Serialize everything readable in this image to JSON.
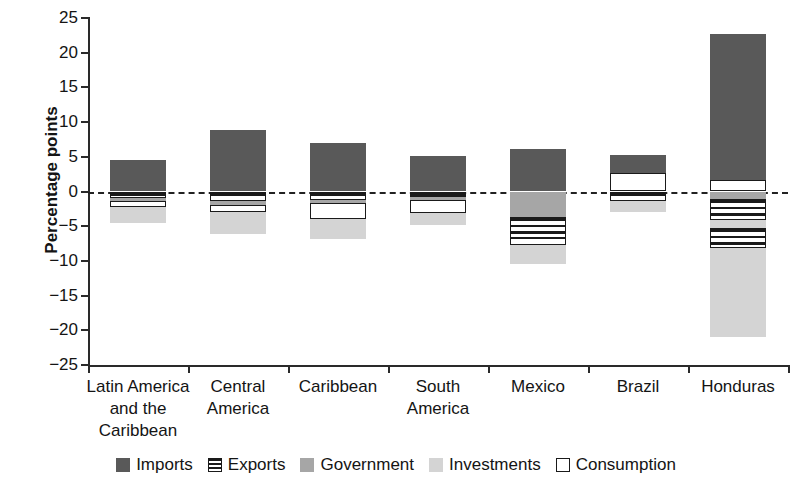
{
  "chart_data": {
    "type": "bar",
    "title": "",
    "subtitle": "",
    "xlabel": "",
    "ylabel": "Percentage points",
    "ylim": [
      -25,
      25
    ],
    "ytick_labels": [
      "25",
      "20",
      "15",
      "10",
      "5",
      "0",
      "-5",
      "-10",
      "-15",
      "-20",
      "-25"
    ],
    "ytick_values": [
      25,
      20,
      15,
      10,
      5,
      0,
      -5,
      -10,
      -15,
      -20,
      -25
    ],
    "grid": false,
    "zero_reference_line": true,
    "legend_position": "bottom",
    "stacked": true,
    "categories": [
      "Latin America\nand the\nCaribbean",
      "Central\nAmerica",
      "Caribbean",
      "South\nAmerica",
      "Mexico",
      "Brazil",
      "Honduras"
    ],
    "series": [
      {
        "name": "Imports",
        "color": "#595959",
        "values": [
          4.6,
          8.9,
          7.0,
          5.1,
          6.1,
          5.3,
          22.7
        ]
      },
      {
        "name": "Exports",
        "color": "#ffffff",
        "pattern": "horizontal-stripes",
        "values": [
          -1.0,
          -1.4,
          -1.2,
          -0.8,
          -3.0,
          -1.3,
          -3.0
        ]
      },
      {
        "name": "Government",
        "color": "#a6a6a6",
        "values": [
          -0.4,
          -0.6,
          -0.5,
          -0.4,
          -3.7,
          -0.5,
          -1.1
        ]
      },
      {
        "name": "Investments",
        "color": "#d4d4d4",
        "values": [
          -2.3,
          -3.2,
          -3.0,
          -1.7,
          -2.8,
          -1.6,
          -11.9
        ]
      },
      {
        "name": "Consumption",
        "color": "#ffffff",
        "values": [
          -0.9,
          -0.9,
          -2.2,
          -1.9,
          -1.0,
          -2.6,
          -1.7
        ]
      }
    ],
    "bars": [
      {
        "category": "Latin America and the Caribbean",
        "positive_stack": [
          {
            "series": "Imports",
            "from": 0.0,
            "to": 4.6
          }
        ],
        "negative_stack": [
          {
            "series": "Exports",
            "from": 0.0,
            "to": -1.0
          },
          {
            "series": "Government",
            "from": -1.0,
            "to": -1.4
          },
          {
            "series": "Consumption",
            "from": -1.4,
            "to": -2.3
          },
          {
            "series": "Investments",
            "from": -2.3,
            "to": -4.6
          }
        ]
      },
      {
        "category": "Central America",
        "positive_stack": [
          {
            "series": "Imports",
            "from": 0.0,
            "to": 8.9
          }
        ],
        "negative_stack": [
          {
            "series": "Exports",
            "from": 0.0,
            "to": -1.4
          },
          {
            "series": "Government",
            "from": -1.4,
            "to": -2.0
          },
          {
            "series": "Consumption",
            "from": -2.0,
            "to": -2.9
          },
          {
            "series": "Investments",
            "from": -2.9,
            "to": -6.1
          }
        ]
      },
      {
        "category": "Caribbean",
        "positive_stack": [
          {
            "series": "Imports",
            "from": 0.0,
            "to": 7.0
          }
        ],
        "negative_stack": [
          {
            "series": "Exports",
            "from": 0.0,
            "to": -1.2
          },
          {
            "series": "Government",
            "from": -1.2,
            "to": -1.7
          },
          {
            "series": "Consumption",
            "from": -1.7,
            "to": -3.9
          },
          {
            "series": "Investments",
            "from": -3.9,
            "to": -6.9
          }
        ]
      },
      {
        "category": "South America",
        "positive_stack": [
          {
            "series": "Imports",
            "from": 0.0,
            "to": 5.1
          }
        ],
        "negative_stack": [
          {
            "series": "Exports",
            "from": 0.0,
            "to": -0.8
          },
          {
            "series": "Government",
            "from": -0.8,
            "to": -1.2
          },
          {
            "series": "Consumption",
            "from": -1.2,
            "to": -3.1
          },
          {
            "series": "Investments",
            "from": -3.1,
            "to": -4.8
          }
        ]
      },
      {
        "category": "Mexico",
        "positive_stack": [
          {
            "series": "Imports",
            "from": 0.0,
            "to": 6.1
          }
        ],
        "negative_stack": [
          {
            "series": "Government",
            "from": 0.0,
            "to": -3.7
          },
          {
            "series": "Exports",
            "from": -3.7,
            "to": -6.7
          },
          {
            "series": "Consumption",
            "from": -6.7,
            "to": -7.7
          },
          {
            "series": "Investments",
            "from": -7.7,
            "to": -10.5
          }
        ]
      },
      {
        "category": "Brazil",
        "positive_stack": [
          {
            "series": "Imports",
            "from": 0.0,
            "to": 5.3
          },
          {
            "series": "Consumption",
            "from": 0.0,
            "to": 2.6
          }
        ],
        "negative_stack": [
          {
            "series": "Exports",
            "from": 0.0,
            "to": -1.3
          },
          {
            "series": "Investments",
            "from": -1.3,
            "to": -2.9
          }
        ]
      },
      {
        "category": "Honduras",
        "positive_stack": [
          {
            "series": "Imports",
            "from": 0.0,
            "to": 22.7
          },
          {
            "series": "Consumption",
            "from": 0.0,
            "to": 1.7
          }
        ],
        "negative_stack": [
          {
            "series": "Government",
            "from": 0.0,
            "to": -1.1
          },
          {
            "series": "Exports",
            "from": -1.1,
            "to": -4.1
          },
          {
            "series": "Investments",
            "from": -4.1,
            "to": -5.2
          },
          {
            "series": "Exports2",
            "from": -5.2,
            "to": -8.2
          },
          {
            "series": "Investments2",
            "from": -8.2,
            "to": -20.9
          }
        ]
      }
    ]
  },
  "legend": {
    "items": [
      {
        "label": "Imports",
        "swatch": "imports"
      },
      {
        "label": "Exports",
        "swatch": "exports"
      },
      {
        "label": "Government",
        "swatch": "government"
      },
      {
        "label": "Investments",
        "swatch": "investments"
      },
      {
        "label": "Consumption",
        "swatch": "consumption"
      }
    ]
  }
}
